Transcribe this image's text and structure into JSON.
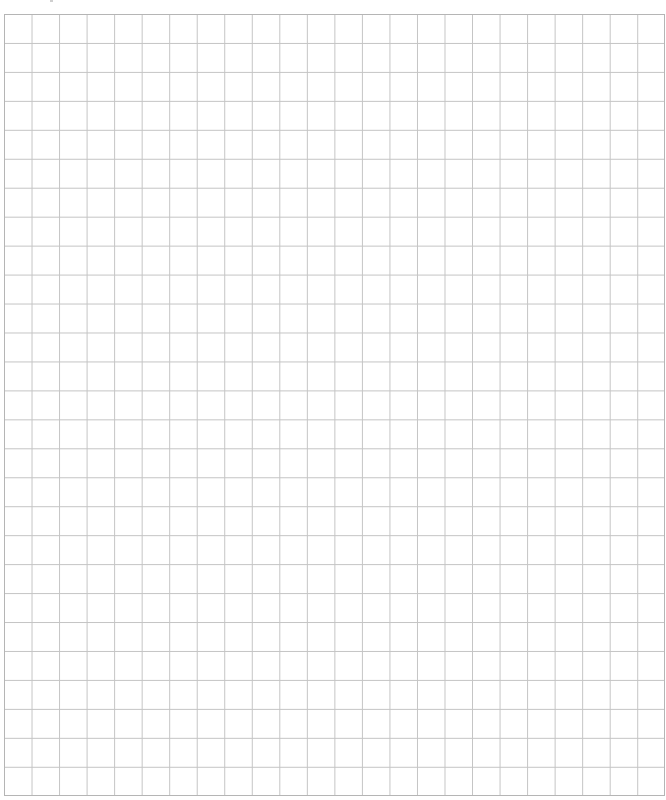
{
  "page": {
    "type": "grid-paper",
    "grid": {
      "columns": 24,
      "rows": 27,
      "line_color": "#c4c4c4",
      "border_color": "#b5b5b5",
      "background": "#ffffff"
    }
  }
}
